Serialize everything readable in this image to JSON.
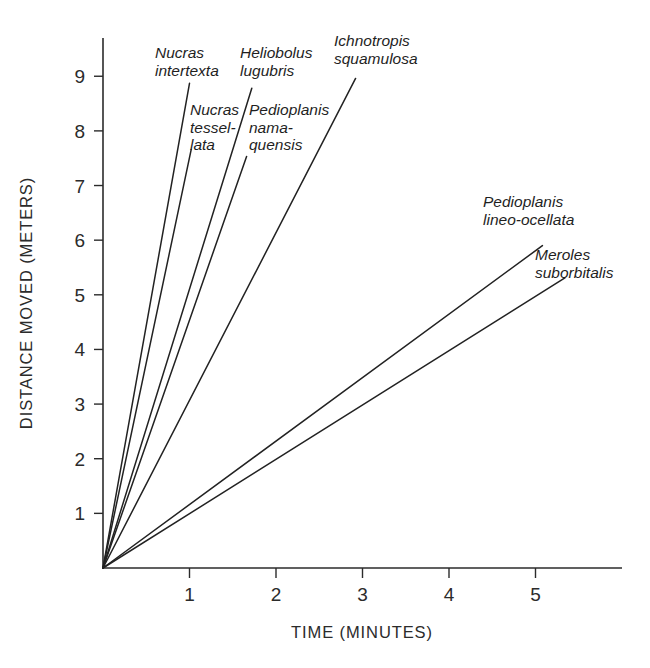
{
  "chart_data": {
    "type": "line",
    "title": "",
    "xlabel": "TIME (MINUTES)",
    "ylabel": "DISTANCE MOVED (METERS)",
    "xlim": [
      0,
      6.0
    ],
    "ylim": [
      0,
      9.7
    ],
    "xticks": [
      "1",
      "2",
      "3",
      "4",
      "5"
    ],
    "xtick_values": [
      1,
      2,
      3,
      4,
      5
    ],
    "yticks": [
      "1",
      "2",
      "3",
      "4",
      "5",
      "6",
      "7",
      "8",
      "9"
    ],
    "ytick_values": [
      1,
      2,
      3,
      4,
      5,
      6,
      7,
      8,
      9
    ],
    "grid": false,
    "legend": "inline-labels",
    "series": [
      {
        "name": "Nucras intertexta",
        "label_lines": [
          "Nucras",
          "intertexta"
        ],
        "slope_m_per_min": 8.87,
        "x": [
          0,
          1.0
        ],
        "y": [
          0,
          8.87
        ]
      },
      {
        "name": "Nucras tessellata",
        "label_lines": [
          "Nucras",
          "tessel-",
          "lata"
        ],
        "slope_m_per_min": 7.5,
        "x": [
          0,
          1.02
        ],
        "y": [
          0,
          7.66
        ]
      },
      {
        "name": "Heliobolus lugubris",
        "label_lines": [
          "Heliobolus",
          "lugubris"
        ],
        "slope_m_per_min": 5.1,
        "x": [
          0,
          1.72
        ],
        "y": [
          0,
          8.78
        ]
      },
      {
        "name": "Pedioplanis namaquensis",
        "label_lines": [
          "Pedioplanis",
          "nama-",
          "quensis"
        ],
        "slope_m_per_min": 4.53,
        "x": [
          0,
          1.66
        ],
        "y": [
          0,
          7.53
        ]
      },
      {
        "name": "Ichnotropis squamulosa",
        "label_lines": [
          "Ichnotropis",
          "squamulosa"
        ],
        "slope_m_per_min": 3.07,
        "x": [
          0,
          2.92
        ],
        "y": [
          0,
          8.96
        ]
      },
      {
        "name": "Pedioplanis lineo-ocellata",
        "label_lines": [
          "Pedioplanis",
          "lineo-ocellata"
        ],
        "slope_m_per_min": 1.16,
        "x": [
          0,
          5.08
        ],
        "y": [
          0,
          5.9
        ]
      },
      {
        "name": "Meroles suborbitalis",
        "label_lines": [
          "Meroles",
          "suborbitalis"
        ],
        "slope_m_per_min": 0.99,
        "x": [
          0,
          5.34
        ],
        "y": [
          0,
          5.31
        ]
      }
    ]
  },
  "labels": {
    "nucras_intertexta": "Nucras\nintertexta",
    "nucras_tessellata": "Nucras\ntessel-\nlata",
    "heliobolus_lugubris": "Heliobolus\nlugubris",
    "pedioplanis_namaquensis": "Pedioplanis\nnama-\nquensis",
    "ichnotropis_squamulosa": "Ichnotropis\nsquamulosa",
    "pedioplanis_lineo_ocellata": "Pedioplanis\nlineo-ocellata",
    "meroles_suborbitalis": "Meroles\nsuborbitalis"
  },
  "colors": {
    "line": "#222222",
    "axis": "#2b2b2b",
    "text": "#1f1f1f",
    "background": "#ffffff"
  }
}
